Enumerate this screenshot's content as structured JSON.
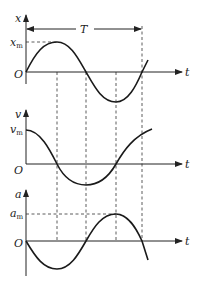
{
  "diagram": {
    "period_label": "T",
    "graphs": [
      {
        "name": "displacement",
        "y_axis_label": "x",
        "x_axis_label": "t",
        "origin_label": "O",
        "amplitude_label": "x",
        "amplitude_sub": "m",
        "curve": "sine"
      },
      {
        "name": "velocity",
        "y_axis_label": "v",
        "x_axis_label": "t",
        "origin_label": "O",
        "amplitude_label": "v",
        "amplitude_sub": "m",
        "curve": "cosine"
      },
      {
        "name": "acceleration",
        "y_axis_label": "a",
        "x_axis_label": "t",
        "origin_label": "O",
        "amplitude_label": "a",
        "amplitude_sub": "m",
        "curve": "negative sine"
      }
    ],
    "quarter_period_markers": [
      "T/4",
      "T/2",
      "3T/4",
      "T"
    ]
  }
}
